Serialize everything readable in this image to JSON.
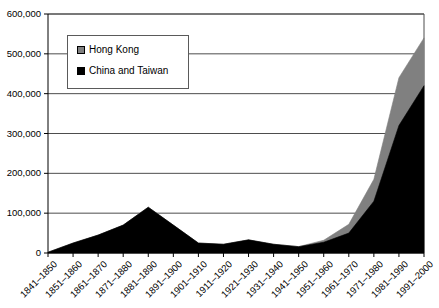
{
  "chart_data": {
    "type": "area",
    "stacked": true,
    "title": "",
    "xlabel": "",
    "ylabel": "",
    "ylim": [
      0,
      600000
    ],
    "ytick_labels": [
      "600,000",
      "500,000",
      "400,000",
      "300,000",
      "200,000",
      "100,000",
      "0"
    ],
    "ytick_values": [
      600000,
      500000,
      400000,
      300000,
      200000,
      100000,
      0
    ],
    "grid": true,
    "legend_position": "upper-left-inside",
    "categories": [
      "1841–1850",
      "1851–1860",
      "1861–1870",
      "1871–1880",
      "1881–1890",
      "1891–1900",
      "1901–1910",
      "1911–1920",
      "1921–1930",
      "1931–1940",
      "1941–1950",
      "1951–1960",
      "1961–1970",
      "1971–1980",
      "1981–1990",
      "1991–2000"
    ],
    "series": [
      {
        "name": "China and Taiwan",
        "color": "#000000",
        "values": [
          2000,
          25000,
          45000,
          70000,
          115000,
          70000,
          25000,
          22000,
          33000,
          22000,
          16000,
          27000,
          50000,
          130000,
          320000,
          420000
        ]
      },
      {
        "name": "Hong Kong",
        "color": "#808080",
        "values": [
          0,
          0,
          0,
          0,
          0,
          0,
          0,
          0,
          0,
          0,
          0,
          5000,
          22000,
          55000,
          120000,
          120000
        ]
      }
    ],
    "series_totals": [
      2000,
      25000,
      45000,
      70000,
      115000,
      70000,
      25000,
      22000,
      33000,
      22000,
      16000,
      32000,
      72000,
      185000,
      440000,
      540000
    ]
  },
  "legend": {
    "items": [
      {
        "label": "Hong Kong",
        "color": "#808080"
      },
      {
        "label": "China and Taiwan",
        "color": "#000000"
      }
    ]
  }
}
